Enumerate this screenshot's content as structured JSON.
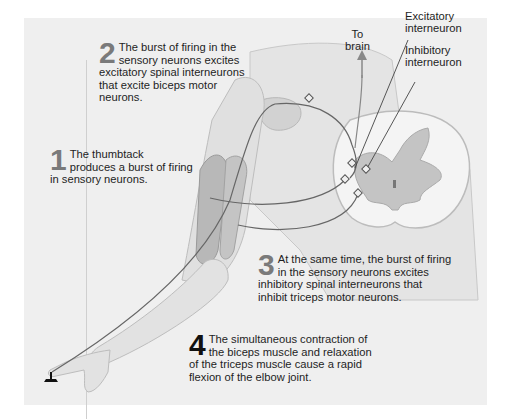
{
  "figure": {
    "colors": {
      "background_panel": "#efefef",
      "skin": "#e2e2e2",
      "skin_outline": "#bdbdbd",
      "muscle": "#b9b9b9",
      "grey_matter": "#c4c4c4",
      "nerve": "#6a6a6a",
      "step_number": "#7a7a7a",
      "step_number_final": "#111111"
    },
    "labels": {
      "to_brain": [
        "To",
        "brain"
      ],
      "excitatory": [
        "Excitatory",
        "interneuron"
      ],
      "inhibitory": [
        "Inhibitory",
        "interneuron"
      ]
    },
    "steps": [
      {
        "number": "1",
        "lines": [
          "The thumbtack",
          "produces a burst of firing",
          "in sensory neurons."
        ]
      },
      {
        "number": "2",
        "lines": [
          "The burst of firing in the",
          "sensory neurons excites",
          "excitatory spinal interneurons",
          "that excite biceps motor",
          "neurons."
        ]
      },
      {
        "number": "3",
        "lines": [
          "At the same time, the burst of firing",
          "in the sensory neurons excites",
          "inhibitory spinal interneurons that",
          "inhibit triceps motor neurons."
        ]
      },
      {
        "number": "4",
        "lines": [
          "The simultaneous contraction of",
          "the biceps muscle and relaxation",
          "of the triceps muscle cause a rapid",
          "flexion of the elbow joint."
        ]
      }
    ],
    "icons": {
      "thumbtack": "thumbtack-icon",
      "arrow_up": "arrow-up-icon"
    }
  }
}
